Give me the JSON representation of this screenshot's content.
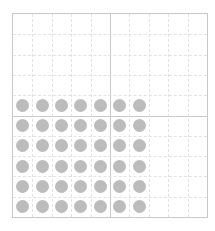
{
  "grid": {
    "columns": 10,
    "rows": 10,
    "divider_column": 5,
    "divider_row": 5,
    "line_color": "#e2e2e2",
    "border_color": "#c8c8c8"
  },
  "dots": {
    "color": "#bcbcbc",
    "columns": 7,
    "rows": 6,
    "start_row": 4,
    "total": 42
  }
}
